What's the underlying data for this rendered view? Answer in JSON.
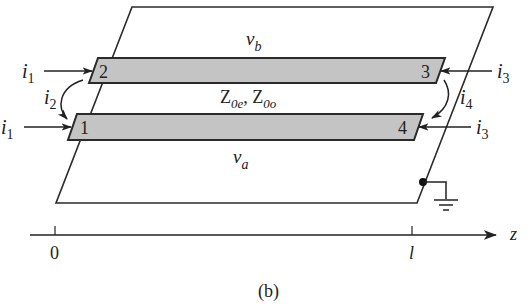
{
  "figure": {
    "caption": "(b)",
    "ground_plane": {
      "fill": "#ffffff",
      "stroke": "#2a2a2a"
    },
    "strips": {
      "fill": "#c4c4c4",
      "stroke": "#2a2a2a",
      "upper": {
        "left_port": "2",
        "right_port": "3"
      },
      "lower": {
        "left_port": "1",
        "right_port": "4"
      }
    },
    "voltages": {
      "upper": {
        "base": "v",
        "sub": "b"
      },
      "lower": {
        "base": "v",
        "sub": "a"
      }
    },
    "impedance": {
      "even": {
        "base": "Z",
        "sub": "0e"
      },
      "separator": ", ",
      "odd": {
        "base": "Z",
        "sub": "0o"
      }
    },
    "currents": {
      "port2_in": {
        "base": "i",
        "sub": "1"
      },
      "port1_in": {
        "base": "i",
        "sub": "1"
      },
      "port3_in": {
        "base": "i",
        "sub": "3"
      },
      "port4_in": {
        "base": "i",
        "sub": "3"
      },
      "left_loop": {
        "base": "i",
        "sub": "2"
      },
      "right_loop": {
        "base": "i",
        "sub": "4"
      }
    },
    "axis": {
      "label": "z",
      "ticks": [
        {
          "label": "0"
        },
        {
          "label": "l"
        }
      ]
    },
    "ground_symbol": "ground-icon"
  }
}
